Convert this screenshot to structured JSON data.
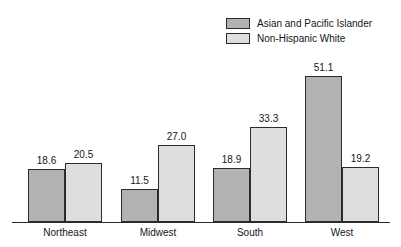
{
  "chart_data": {
    "type": "bar",
    "title": "",
    "subtitle": "",
    "xlabel": "",
    "ylabel": "",
    "ylim": [
      0,
      51.1
    ],
    "grid": false,
    "legend_position": "top-right",
    "categories": [
      "Northeast",
      "Midwest",
      "South",
      "West"
    ],
    "series": [
      {
        "name": "Asian and Pacific Islander",
        "color": "#b2b2b2",
        "values": [
          18.6,
          11.5,
          18.9,
          51.1
        ],
        "labels": [
          "18.6",
          "11.5",
          "18.9",
          "51.1"
        ]
      },
      {
        "name": "Non-Hispanic White",
        "color": "#dedede",
        "values": [
          20.5,
          27.0,
          33.3,
          19.2
        ],
        "labels": [
          "20.5",
          "27.0",
          "33.3",
          "19.2"
        ]
      }
    ]
  },
  "legend": {
    "items": [
      {
        "label": "Asian and Pacific Islander",
        "swatch_color": "#b2b2b2"
      },
      {
        "label": "Non-Hispanic White",
        "swatch_color": "#dedede"
      }
    ]
  },
  "axis": {
    "baseline_color": "#2b2b2b",
    "bar_border_color": "#2b2b2b"
  }
}
